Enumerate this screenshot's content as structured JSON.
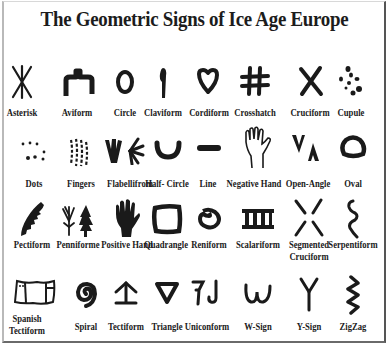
{
  "title": "The Geometric Signs of Ice Age Europe",
  "colors": {
    "ink": "#1a1a1a",
    "background": "#ffffff",
    "frame": "#555555"
  },
  "rows": [
    {
      "signs": [
        {
          "name": "Asterisk",
          "icon": "asterisk-sign"
        },
        {
          "name": "Aviform",
          "icon": "aviform-sign"
        },
        {
          "name": "Circle",
          "icon": "circle-sign"
        },
        {
          "name": "Claviform",
          "icon": "claviform-sign"
        },
        {
          "name": "Cordiform",
          "icon": "cordiform-sign"
        },
        {
          "name": "Crosshatch",
          "icon": "crosshatch-sign"
        },
        {
          "name": "Cruciform",
          "icon": "cruciform-sign"
        },
        {
          "name": "Cupule",
          "icon": "cupule-sign"
        }
      ]
    },
    {
      "signs": [
        {
          "name": "Dots",
          "icon": "dots-sign"
        },
        {
          "name": "Fingers",
          "icon": "fingers-sign"
        },
        {
          "name": "Flabellifrom",
          "icon": "flabelliform-sign"
        },
        {
          "name": "Half- Circle",
          "icon": "half-circle-sign"
        },
        {
          "name": "Line",
          "icon": "line-sign"
        },
        {
          "name": "Negative Hand",
          "icon": "negative-hand-sign"
        },
        {
          "name": "Open-Angle",
          "icon": "open-angle-sign"
        },
        {
          "name": "Oval",
          "icon": "oval-sign"
        }
      ]
    },
    {
      "signs": [
        {
          "name": "Pectiform",
          "icon": "pectiform-sign"
        },
        {
          "name": "Penniforme",
          "icon": "penniform-sign"
        },
        {
          "name": "Positive Hand",
          "icon": "positive-hand-sign"
        },
        {
          "name": "Quadrangle",
          "icon": "quadrangle-sign"
        },
        {
          "name": "Reniform",
          "icon": "reniform-sign"
        },
        {
          "name": "Scalariform",
          "icon": "scalariform-sign"
        },
        {
          "name": "Segmented",
          "name2": "Cruciform",
          "icon": "segmented-cruciform-sign"
        },
        {
          "name": "Serpentiform",
          "icon": "serpentiform-sign"
        }
      ]
    },
    {
      "signs": [
        {
          "name": "Spanish",
          "name2": "Tectiform",
          "icon": "spanish-tectiform-sign"
        },
        {
          "name": "Spiral",
          "icon": "spiral-sign"
        },
        {
          "name": "Tectiform",
          "icon": "tectiform-sign"
        },
        {
          "name": "Triangle",
          "icon": "triangle-sign"
        },
        {
          "name": "Uniconform",
          "icon": "uniconform-sign"
        },
        {
          "name": "W-Sign",
          "icon": "w-sign"
        },
        {
          "name": "Y-Sign",
          "icon": "y-sign"
        },
        {
          "name": "ZigZag",
          "icon": "zigzag-sign"
        }
      ]
    }
  ]
}
